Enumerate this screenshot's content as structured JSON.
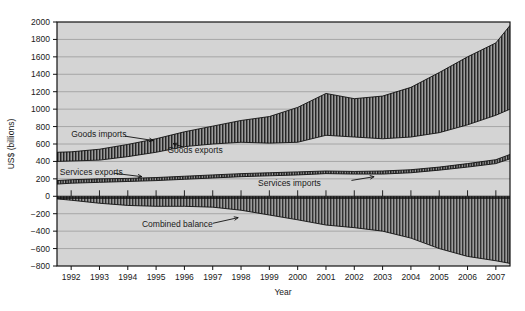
{
  "chart_data": {
    "type": "area",
    "title": "",
    "xlabel": "Year",
    "ylabel": "US$ (billions)",
    "xlim": [
      1991.5,
      2007.5
    ],
    "ylim": [
      -800,
      2000
    ],
    "grid": true,
    "legend_position": "inline-annotations",
    "x_tick_labels": [
      "1992",
      "1993",
      "1994",
      "1995",
      "1996",
      "1997",
      "1998",
      "1999",
      "2000",
      "2001",
      "2002",
      "2003",
      "2004",
      "2005",
      "2006",
      "2007"
    ],
    "y_tick_labels": [
      "2000",
      "1800",
      "1600",
      "1400",
      "1200",
      "1000",
      "800",
      "600",
      "400",
      "200",
      "0",
      "-200",
      "-400",
      "-600",
      "-800"
    ],
    "y_ticks": [
      2000,
      1800,
      1600,
      1400,
      1200,
      1000,
      800,
      600,
      400,
      200,
      0,
      -200,
      -400,
      -600,
      -800
    ],
    "x": [
      1991.5,
      1992,
      1993,
      1994,
      1995,
      1996,
      1997,
      1998,
      1999,
      2000,
      2001,
      2002,
      2003,
      2004,
      2005,
      2006,
      2007,
      2007.5
    ],
    "series": [
      {
        "name": "Goods exports",
        "label": "Goods exports",
        "values": [
          400,
          405,
          415,
          455,
          505,
          570,
          600,
          620,
          610,
          620,
          700,
          680,
          660,
          680,
          730,
          820,
          930,
          1000
        ]
      },
      {
        "name": "Goods imports",
        "label": "Goods imports",
        "values": [
          505,
          510,
          540,
          595,
          660,
          740,
          805,
          870,
          915,
          1020,
          1180,
          1120,
          1150,
          1250,
          1420,
          1600,
          1760,
          1960
        ]
      },
      {
        "name": "Services exports",
        "label": "Services exports",
        "values": [
          140,
          150,
          160,
          170,
          180,
          195,
          210,
          225,
          235,
          245,
          260,
          255,
          255,
          270,
          300,
          335,
          375,
          430
        ]
      },
      {
        "name": "Services imports",
        "label": "Services imports",
        "values": [
          180,
          190,
          200,
          205,
          215,
          230,
          245,
          260,
          270,
          280,
          290,
          285,
          290,
          305,
          335,
          375,
          420,
          480
        ]
      },
      {
        "name": "Combined balance",
        "label": "Combined balance",
        "values": [
          -30,
          -45,
          -80,
          -105,
          -115,
          -115,
          -125,
          -160,
          -215,
          -270,
          -330,
          -360,
          -400,
          -480,
          -600,
          -690,
          -740,
          -770
        ]
      }
    ],
    "annotations": [
      {
        "text": "Goods imports",
        "x": 1992.0,
        "y": 720
      },
      {
        "text": "Goods exports",
        "x": 1995.4,
        "y": 530
      },
      {
        "text": "Services exports",
        "x": 1991.6,
        "y": 280
      },
      {
        "text": "Services imports",
        "x": 1998.6,
        "y": 155
      },
      {
        "text": "Combined balance",
        "x": 1994.5,
        "y": -320
      }
    ],
    "colors": {
      "plot_background": "#d4d4d4",
      "figure_background": "#ffffff",
      "band_fill": "#8c8c8c",
      "band_hatch": "#2b2b2b",
      "gridline": "#9a9a9a",
      "axis": "#111111",
      "text": "#1a1a1a"
    }
  }
}
